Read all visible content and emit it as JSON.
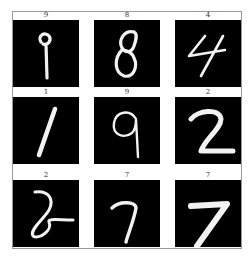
{
  "figure": {
    "grid": {
      "rows": 3,
      "cols": 3
    },
    "colors": {
      "background": "#ffffff",
      "panel": "#000000",
      "stroke": "#f2f2f2",
      "frame": "#9a9a9a"
    },
    "samples": [
      {
        "label": "9",
        "digit": "9"
      },
      {
        "label": "8",
        "digit": "8"
      },
      {
        "label": "4",
        "digit": "4"
      },
      {
        "label": "1",
        "digit": "1"
      },
      {
        "label": "9",
        "digit": "9"
      },
      {
        "label": "2",
        "digit": "2"
      },
      {
        "label": "2",
        "digit": "2"
      },
      {
        "label": "7",
        "digit": "7"
      },
      {
        "label": "7",
        "digit": "7"
      }
    ]
  }
}
